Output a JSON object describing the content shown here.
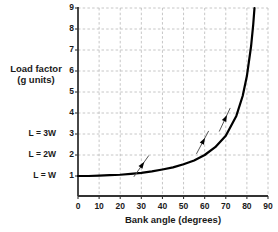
{
  "chart_data": {
    "type": "line",
    "title": "",
    "xlabel": "Bank angle (degrees)",
    "ylabel_line1": "Load factor",
    "ylabel_line2": "(g units)",
    "xlim": [
      0,
      90
    ],
    "ylim": [
      0,
      9
    ],
    "xticks": [
      0,
      10,
      20,
      30,
      40,
      50,
      60,
      70,
      80,
      90
    ],
    "yticks": [
      1,
      2,
      3,
      4,
      5,
      6,
      7,
      8,
      9
    ],
    "grid": true,
    "legend": "none",
    "series": [
      {
        "name": "Load factor n = 1/cos(bank angle)",
        "x": [
          0,
          5,
          10,
          15,
          20,
          25,
          30,
          35,
          40,
          45,
          50,
          55,
          60,
          65,
          70,
          75,
          78,
          80,
          82,
          83,
          83.6
        ],
        "values": [
          1.0,
          1.0,
          1.02,
          1.04,
          1.06,
          1.1,
          1.15,
          1.22,
          1.31,
          1.41,
          1.56,
          1.74,
          2.0,
          2.37,
          2.92,
          3.86,
          4.81,
          5.76,
          7.19,
          8.21,
          9.0
        ]
      }
    ],
    "annotations": [
      {
        "name": "arrow-marker-1",
        "x": 30,
        "y": 1.47,
        "angle_deg": 55,
        "length": 26
      },
      {
        "name": "arrow-marker-2",
        "x": 59,
        "y": 2.6,
        "angle_deg": 62,
        "length": 26
      },
      {
        "name": "arrow-marker-3",
        "x": 69.5,
        "y": 3.68,
        "angle_deg": 65,
        "length": 26
      }
    ],
    "reference_labels": [
      {
        "label": "L = 3W",
        "y": 3
      },
      {
        "label": "L = 2W",
        "y": 2
      },
      {
        "label": "L = W",
        "y": 1
      }
    ],
    "colors": {
      "curve": "#000000",
      "axis": "#333333",
      "grid": "#b8b8b8",
      "text": "#1a1a1a",
      "background": "#ffffff"
    }
  }
}
